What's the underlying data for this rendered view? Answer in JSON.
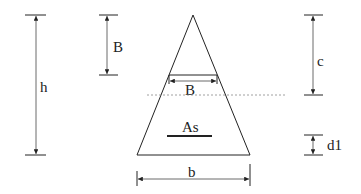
{
  "diagram": {
    "type": "triangular cross-section with dimension annotations",
    "labels": {
      "height": "h",
      "top_width_dim": "B",
      "inner_width": "B",
      "neutral_depth": "c",
      "steel_area": "As",
      "cover": "d1",
      "base_width": "b"
    },
    "colors": {
      "stroke": "#222222",
      "neutral_axis": "#888888",
      "background": "#ffffff"
    }
  }
}
